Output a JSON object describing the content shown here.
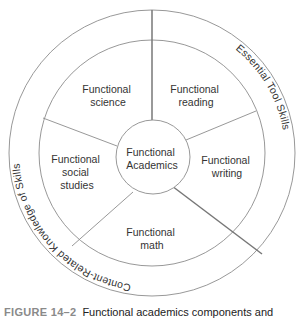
{
  "diagram": {
    "center_label": [
      "Functional",
      "Academics"
    ],
    "sections": [
      {
        "name": "science",
        "lines": [
          "Functional",
          "science"
        ]
      },
      {
        "name": "reading",
        "lines": [
          "Functional",
          "reading"
        ]
      },
      {
        "name": "writing",
        "lines": [
          "Functional",
          "writing"
        ]
      },
      {
        "name": "math",
        "lines": [
          "Functional",
          "math"
        ]
      },
      {
        "name": "social-studies",
        "lines": [
          "Functional",
          "social",
          "studies"
        ]
      }
    ],
    "outer_ring": {
      "essential": "Essential Tool Skills",
      "content": "Content-Related Knowledge of Skills"
    },
    "colors": {
      "line": "#8c8c8c",
      "thick_line": "#777777",
      "text": "#333333"
    }
  },
  "caption": {
    "figure_number": "FIGURE 14–2",
    "text": "Functional academics components and"
  }
}
